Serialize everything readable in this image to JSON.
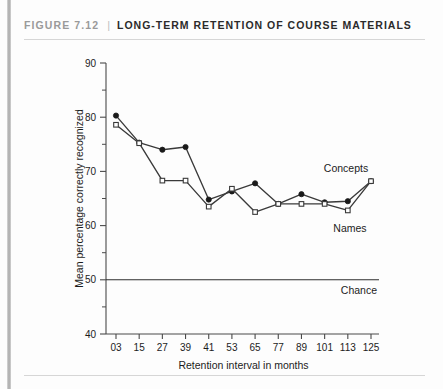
{
  "figure": {
    "number_label": "FIGURE 7.12",
    "separator": "|",
    "title": "LONG-TERM RETENTION OF COURSE MATERIALS"
  },
  "chart_data": {
    "type": "line",
    "title": "LONG-TERM RETENTION OF COURSE MATERIALS",
    "xlabel": "Retention interval in months",
    "ylabel": "Mean percentage correctly recognized",
    "categories": [
      "03",
      "15",
      "27",
      "39",
      "41",
      "53",
      "65",
      "77",
      "89",
      "101",
      "113",
      "125"
    ],
    "xlim": [
      0,
      11
    ],
    "ylim": [
      40,
      90
    ],
    "yticks": [
      40,
      50,
      60,
      70,
      80,
      90
    ],
    "yticks_minor": [
      45,
      55,
      65,
      75,
      85
    ],
    "grid": false,
    "legend": "inline-annotations",
    "series": [
      {
        "name": "Concepts",
        "marker": "filled-circle",
        "values": [
          80.3,
          75.3,
          74.0,
          74.5,
          64.8,
          66.3,
          67.8,
          64.0,
          65.8,
          64.3,
          64.5,
          68.2
        ]
      },
      {
        "name": "Names",
        "marker": "open-square",
        "values": [
          78.6,
          75.2,
          68.3,
          68.3,
          63.5,
          66.8,
          62.5,
          64.0,
          64.0,
          64.0,
          62.8,
          68.2
        ]
      }
    ],
    "reference_lines": [
      {
        "label": "Chance",
        "value": 50
      }
    ],
    "annotations": [
      {
        "text": "Concepts",
        "near": "upper-right"
      },
      {
        "text": "Names",
        "near": "lower-right"
      },
      {
        "text": "Chance",
        "near": "chance-line-right"
      }
    ]
  }
}
